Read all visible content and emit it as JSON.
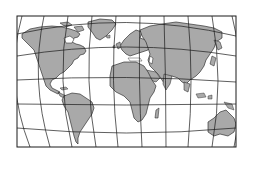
{
  "map": {
    "type": "world-map",
    "projection": "curved-graticule",
    "frame": {
      "x": 17,
      "y": 16,
      "width": 219,
      "height": 131
    },
    "colors": {
      "background": "#ffffff",
      "land": "#a9a9a9",
      "ocean": "#ffffff",
      "graticule": "#1a1a1a",
      "coastline": "#1a1a1a",
      "frame": "#1a1a1a"
    },
    "regions": [
      {
        "name": "North America"
      },
      {
        "name": "Greenland"
      },
      {
        "name": "South America"
      },
      {
        "name": "Europe"
      },
      {
        "name": "Africa"
      },
      {
        "name": "Madagascar"
      },
      {
        "name": "Asia"
      },
      {
        "name": "Arabian Peninsula"
      },
      {
        "name": "India"
      },
      {
        "name": "Japan"
      },
      {
        "name": "Indonesia"
      },
      {
        "name": "Australia"
      },
      {
        "name": "New Zealand"
      },
      {
        "name": "British Isles"
      }
    ]
  }
}
